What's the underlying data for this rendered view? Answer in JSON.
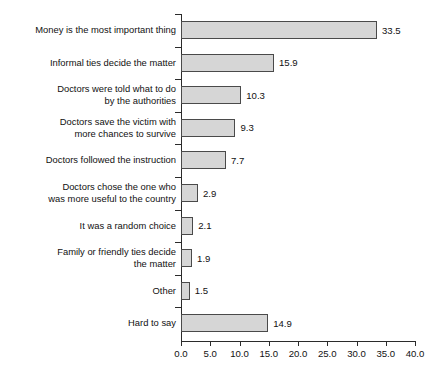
{
  "chart_data": {
    "type": "bar",
    "orientation": "horizontal",
    "title": "",
    "subtitle": "",
    "xlabel": "",
    "ylabel": "",
    "xlim": [
      0.0,
      40.0
    ],
    "xticks": [
      "0.0",
      "5.0",
      "10.0",
      "15.0",
      "20.0",
      "25.0",
      "30.0",
      "35.0",
      "40.0"
    ],
    "xtick_step": 5.0,
    "grid": false,
    "legend": false,
    "bar_fill_color": "#d6d6d6",
    "bar_edge_color": "#4a4a4a",
    "axis_color": "#2b2b2b",
    "background_color": "#ffffff",
    "categories": [
      "Money is the most important thing",
      "Informal ties decide the matter",
      "Doctors were told what to do by the authorities",
      "Doctors save the victim with more chances to survive",
      "Doctors followed the instruction",
      "Doctors chose the one who was more useful to the country",
      "It was a random choice",
      "Family or friendly ties decide the matter",
      "Other",
      "Hard to say"
    ],
    "category_lines": [
      [
        "Money is the most important thing"
      ],
      [
        "Informal ties decide the matter"
      ],
      [
        "Doctors were told what to do",
        "by the authorities"
      ],
      [
        "Doctors save the victim with",
        "more chances to survive"
      ],
      [
        "Doctors followed the instruction"
      ],
      [
        "Doctors chose the one who",
        "was more useful to the country"
      ],
      [
        "It was a random choice"
      ],
      [
        "Family or friendly ties decide",
        "the matter"
      ],
      [
        "Other"
      ],
      [
        "Hard to say"
      ]
    ],
    "values": [
      33.5,
      15.9,
      10.3,
      9.3,
      7.7,
      2.9,
      2.1,
      1.9,
      1.5,
      14.9
    ],
    "value_labels": [
      "33.5",
      "15.9",
      "10.3",
      "9.3",
      "7.7",
      "2.9",
      "2.1",
      "1.9",
      "1.5",
      "14.9"
    ]
  }
}
